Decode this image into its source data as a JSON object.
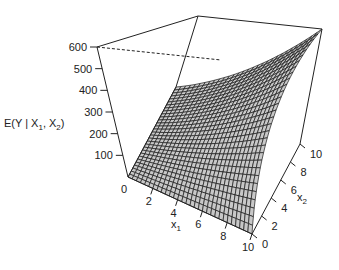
{
  "chart_data": {
    "type": "surface",
    "title": "",
    "function": "E(Y | X1, X2) = 6 * x1 * x2",
    "xlabel": "x1",
    "ylabel": "x2",
    "zlabel": "E(Y | X1, X2)",
    "x_ticks": [
      0,
      2,
      4,
      6,
      8,
      10
    ],
    "y_ticks": [
      0,
      2,
      4,
      6,
      8,
      10
    ],
    "z_ticks": [
      0,
      100,
      200,
      300,
      400,
      500,
      600
    ],
    "xlim": [
      0,
      10
    ],
    "ylim": [
      0,
      10
    ],
    "zlim": [
      0,
      600
    ],
    "grid_resolution": 30,
    "surface_color": "#c8c8c8",
    "mesh_color": "#1a1a1a",
    "box": true
  },
  "labels": {
    "z_title_main": "E(Y | X",
    "z_title_sub1": "1",
    "z_title_mid": ", X",
    "z_title_sub2": "2",
    "z_title_end": ")",
    "x1_main": "x",
    "x1_sub": "1",
    "x2_main": "x",
    "x2_sub": "2"
  }
}
